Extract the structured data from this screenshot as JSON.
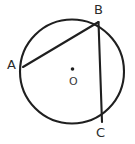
{
  "figure": {
    "kind": "circle-geometry-diagram",
    "background_color": "#ffffff",
    "stroke_color": "#1f1f1f",
    "label_color": "#2b2b2b",
    "width": 135,
    "height": 144,
    "circle": {
      "name": "main-circle",
      "center_x": 72,
      "center_y": 71.5,
      "radius": 52,
      "stroke_width": 2.1
    },
    "center_dot": {
      "name": "center-point",
      "cx": 72.5,
      "cy": 69,
      "r": 1.8
    },
    "points": [
      {
        "id": "A",
        "label": "A",
        "x": 23,
        "y": 67
      },
      {
        "id": "B",
        "label": "B",
        "x": 98.5,
        "y": 22
      },
      {
        "id": "C",
        "label": "C",
        "x": 102,
        "y": 122
      },
      {
        "id": "O",
        "label": "O",
        "x": 72.5,
        "y": 69
      }
    ],
    "chords": [
      {
        "name": "chord-AB",
        "from": "A",
        "to": "B",
        "x1": 23,
        "y1": 67,
        "x2": 98.5,
        "y2": 22,
        "stroke_width": 2.1
      },
      {
        "name": "chord-BC",
        "from": "B",
        "to": "C",
        "x1": 98.5,
        "y1": 22,
        "x2": 102,
        "y2": 122,
        "stroke_width": 2.1
      }
    ],
    "labels": {
      "A": "A",
      "B": "B",
      "C": "C",
      "O": "O"
    }
  }
}
